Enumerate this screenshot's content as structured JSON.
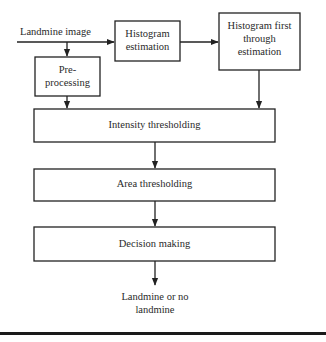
{
  "diagram": {
    "input_label": "Landmine image",
    "nodes": {
      "histogram_estimation": [
        "Histogram",
        "estimation"
      ],
      "histogram_first_through": [
        "Histogram first",
        "through",
        "estimation"
      ],
      "preprocessing": [
        "Pre-",
        "processing"
      ],
      "intensity_thresholding": "Intensity thresholding",
      "area_thresholding": "Area thresholding",
      "decision_making": "Decision making"
    },
    "output_label": [
      "Landmine or no",
      "landmine"
    ],
    "edges": [
      {
        "from": "input",
        "to": "histogram_estimation"
      },
      {
        "from": "input",
        "to": "preprocessing"
      },
      {
        "from": "histogram_estimation",
        "to": "histogram_first_through"
      },
      {
        "from": "preprocessing",
        "to": "intensity_thresholding"
      },
      {
        "from": "histogram_first_through",
        "to": "intensity_thresholding"
      },
      {
        "from": "intensity_thresholding",
        "to": "area_thresholding"
      },
      {
        "from": "area_thresholding",
        "to": "decision_making"
      },
      {
        "from": "decision_making",
        "to": "output"
      }
    ]
  }
}
